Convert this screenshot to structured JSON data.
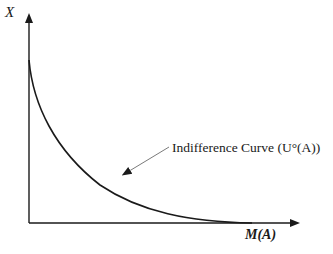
{
  "diagram": {
    "type": "economics-indifference-curve",
    "y_axis": {
      "label": "X"
    },
    "x_axis": {
      "label": "M(A)"
    },
    "curve": {
      "name": "indifference-curve",
      "annotation": "Indifference Curve (U°(A))",
      "shape": "convex, downward-sloping, asymptotic to both axes"
    },
    "colors": {
      "line": "#1a1a1a",
      "annotation_arrow": "#7a7a7a",
      "background": "#ffffff"
    }
  }
}
